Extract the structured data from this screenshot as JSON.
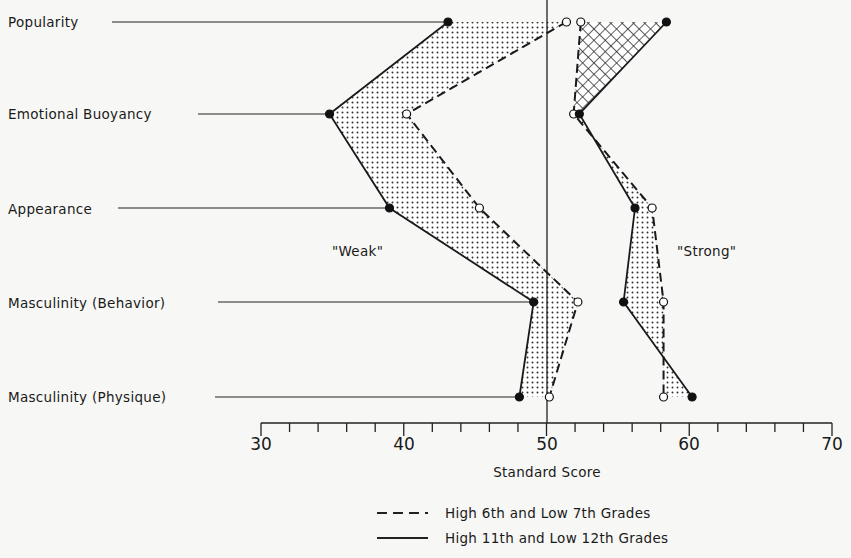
{
  "chart_data": {
    "type": "line",
    "orientation": "horizontal-profile",
    "title": "",
    "xlabel": "Standard Score",
    "ylabel": "",
    "xlim": [
      30,
      70
    ],
    "x_ticks": [
      30,
      40,
      50,
      60,
      70
    ],
    "minor_tick_step": 2,
    "reference_line": 50,
    "grid": false,
    "categories": [
      "Popularity",
      "Emotional Buoyancy",
      "Appearance",
      "Masculinity (Behavior)",
      "Masculinity (Physique)"
    ],
    "groups": [
      {
        "name": "\"Weak\"",
        "series": [
          {
            "name": "High 6th and Low 7th Grades",
            "style": "dashed",
            "marker": "open-circle",
            "values": [
              51.4,
              40.2,
              45.3,
              52.2,
              50.2
            ]
          },
          {
            "name": "High 11th and Low 12th Grades",
            "style": "solid",
            "marker": "filled-circle",
            "values": [
              43.1,
              34.8,
              39.0,
              49.1,
              48.1
            ]
          }
        ]
      },
      {
        "name": "\"Strong\"",
        "series": [
          {
            "name": "High 6th and Low 7th Grades",
            "style": "dashed",
            "marker": "open-circle",
            "values": [
              52.4,
              51.9,
              57.4,
              58.2,
              58.2
            ]
          },
          {
            "name": "High 11th and Low 12th Grades",
            "style": "solid",
            "marker": "filled-circle",
            "values": [
              58.4,
              52.3,
              56.2,
              55.4,
              60.2
            ]
          }
        ]
      }
    ],
    "legend": {
      "position": "bottom-center",
      "entries": [
        {
          "style": "dashed",
          "label": "High 6th and Low 7th Grades"
        },
        {
          "style": "solid",
          "label": "High 11th and Low 12th Grades"
        }
      ]
    },
    "annotations": [
      "\"Weak\"",
      "\"Strong\""
    ]
  },
  "labels": {
    "categories": [
      "Popularity",
      "Emotional Buoyancy",
      "Appearance",
      "Masculinity (Behavior)",
      "Masculinity (Physique)"
    ],
    "weak": "\"Weak\"",
    "strong": "\"Strong\"",
    "xlabel": "Standard Score",
    "ticks": [
      "30",
      "40",
      "50",
      "60",
      "70"
    ],
    "legend_dashed": "High 6th and Low 7th Grades",
    "legend_solid": "High 11th and Low 12th Grades"
  }
}
